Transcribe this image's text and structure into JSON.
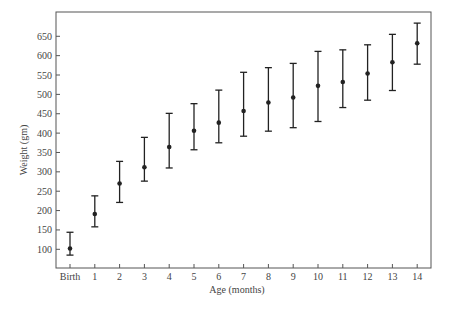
{
  "chart_data": {
    "type": "scatter",
    "subtype": "error-bar",
    "title": "",
    "xlabel": "Age (months)",
    "ylabel": "Weight (gm)",
    "categories": [
      "Birth",
      "1",
      "2",
      "3",
      "4",
      "5",
      "6",
      "7",
      "8",
      "9",
      "10",
      "11",
      "12",
      "13",
      "14"
    ],
    "yticks": [
      100,
      150,
      200,
      250,
      300,
      350,
      400,
      450,
      500,
      550,
      600,
      650
    ],
    "ylim": [
      55,
      695
    ],
    "grid": false,
    "legend": null,
    "series": [
      {
        "name": "Weight",
        "values": [
          102,
          191,
          270,
          312,
          364,
          406,
          427,
          457,
          479,
          492,
          522,
          532,
          554,
          583,
          632
        ],
        "upper": [
          144,
          238,
          327,
          389,
          451,
          476,
          511,
          557,
          569,
          580,
          611,
          615,
          628,
          655,
          684
        ],
        "lower": [
          85,
          158,
          221,
          276,
          310,
          357,
          375,
          392,
          405,
          414,
          430,
          466,
          485,
          510,
          578
        ]
      }
    ]
  },
  "colors": {
    "ink": "#222222",
    "axis": "#555555",
    "background": "#ffffff"
  }
}
